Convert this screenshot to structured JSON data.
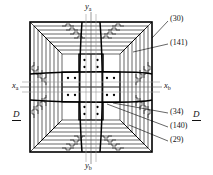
{
  "figure": {
    "type": "patent-cross-section-drawing",
    "background_color": "#ffffff",
    "line_color": "#000000"
  },
  "axes": {
    "vertical_top": {
      "label": "y",
      "subscript": "a"
    },
    "vertical_bottom": {
      "label": "y",
      "subscript": "b"
    },
    "horizontal_left": {
      "label": "x",
      "subscript": "a"
    },
    "horizontal_right": {
      "label": "x",
      "subscript": "b"
    }
  },
  "section_markers": {
    "left": "D",
    "right": "D"
  },
  "reference_numerals": [
    {
      "id": "ref-30",
      "text": "(30)"
    },
    {
      "id": "ref-141",
      "text": "(141)"
    },
    {
      "id": "ref-34",
      "text": "(34)"
    },
    {
      "id": "ref-140",
      "text": "(140)"
    },
    {
      "id": "ref-29",
      "text": "(29)"
    }
  ]
}
